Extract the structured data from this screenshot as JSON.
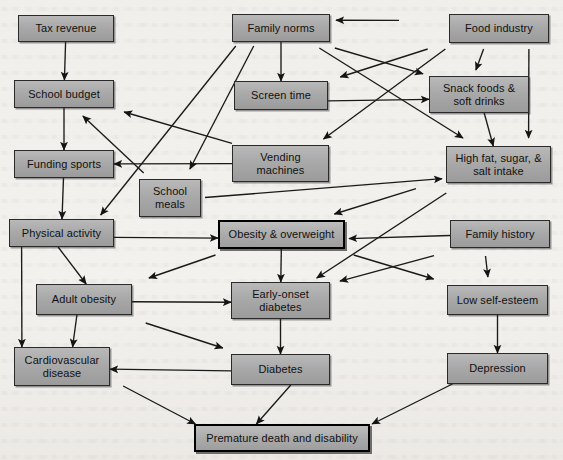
{
  "diagram": {
    "type": "flow-diagram",
    "canvas": {
      "width": 563,
      "height": 460
    },
    "style": {
      "background_color": "#f3f1ee",
      "node_fill_top": "#b9b9b9",
      "node_fill_bottom": "#9b9b9b",
      "node_border": "#2a2a2a",
      "emphasis_border": "#000000",
      "edge_color": "#1a1a1a",
      "text_color": "#111111"
    },
    "nodes": [
      {
        "id": "tax_revenue",
        "label": "Tax revenue",
        "x": 18,
        "y": 15,
        "w": 96,
        "h": 27,
        "emphasis": false
      },
      {
        "id": "school_budget",
        "label": "School budget",
        "x": 14,
        "y": 80,
        "w": 100,
        "h": 28,
        "emphasis": false
      },
      {
        "id": "funding_sports",
        "label": "Funding sports",
        "x": 14,
        "y": 150,
        "w": 100,
        "h": 28,
        "emphasis": false
      },
      {
        "id": "physical_activity",
        "label": "Physical activity",
        "x": 9,
        "y": 219,
        "w": 105,
        "h": 28,
        "emphasis": false
      },
      {
        "id": "adult_obesity",
        "label": "Adult obesity",
        "x": 36,
        "y": 284,
        "w": 96,
        "h": 31,
        "emphasis": false
      },
      {
        "id": "cardiovascular",
        "label": "Cardiovascular\ndisease",
        "x": 14,
        "y": 347,
        "w": 96,
        "h": 39,
        "emphasis": false
      },
      {
        "id": "school_meals",
        "label": "School\nmeals",
        "x": 139,
        "y": 179,
        "w": 62,
        "h": 38,
        "emphasis": false
      },
      {
        "id": "family_norms",
        "label": "Family norms",
        "x": 232,
        "y": 14,
        "w": 98,
        "h": 28,
        "emphasis": false
      },
      {
        "id": "screen_time",
        "label": "Screen time",
        "x": 234,
        "y": 81,
        "w": 94,
        "h": 29,
        "emphasis": false
      },
      {
        "id": "vending",
        "label": "Vending\nmachines",
        "x": 232,
        "y": 145,
        "w": 97,
        "h": 37,
        "emphasis": false
      },
      {
        "id": "obesity",
        "label": "Obesity & overweight",
        "x": 218,
        "y": 220,
        "w": 127,
        "h": 29,
        "emphasis": true
      },
      {
        "id": "early_diabetes",
        "label": "Early-onset\ndiabetes",
        "x": 231,
        "y": 282,
        "w": 99,
        "h": 37,
        "emphasis": false
      },
      {
        "id": "diabetes",
        "label": "Diabetes",
        "x": 231,
        "y": 354,
        "w": 99,
        "h": 31,
        "emphasis": false
      },
      {
        "id": "food_industry",
        "label": "Food industry",
        "x": 449,
        "y": 14,
        "w": 100,
        "h": 29,
        "emphasis": false
      },
      {
        "id": "snack_foods",
        "label": "Snack foods &\nsoft drinks",
        "x": 429,
        "y": 76,
        "w": 100,
        "h": 37,
        "emphasis": false
      },
      {
        "id": "high_fat",
        "label": "High fat, sugar, &\nsalt intake",
        "x": 446,
        "y": 146,
        "w": 105,
        "h": 37,
        "emphasis": false
      },
      {
        "id": "family_history",
        "label": "Family history",
        "x": 450,
        "y": 220,
        "w": 100,
        "h": 28,
        "emphasis": false
      },
      {
        "id": "low_self_esteem",
        "label": "Low self-esteem",
        "x": 447,
        "y": 285,
        "w": 101,
        "h": 30,
        "emphasis": false
      },
      {
        "id": "depression",
        "label": "Depression",
        "x": 447,
        "y": 353,
        "w": 101,
        "h": 31,
        "emphasis": false
      },
      {
        "id": "premature_death",
        "label": "Premature death and disability",
        "x": 194,
        "y": 424,
        "w": 176,
        "h": 28,
        "emphasis": true
      }
    ],
    "edges": [
      {
        "from": "tax_revenue",
        "to": "school_budget"
      },
      {
        "from": "school_budget",
        "to": "funding_sports"
      },
      {
        "from": "funding_sports",
        "to": "physical_activity"
      },
      {
        "from": "physical_activity",
        "to": "adult_obesity"
      },
      {
        "from": "physical_activity",
        "to": "cardiovascular"
      },
      {
        "from": "physical_activity",
        "to": "obesity"
      },
      {
        "from": "adult_obesity",
        "to": "cardiovascular"
      },
      {
        "from": "adult_obesity",
        "to": "early_diabetes"
      },
      {
        "from": "adult_obesity",
        "to": "diabetes"
      },
      {
        "from": "cardiovascular",
        "to": "premature_death"
      },
      {
        "from": "vending",
        "to": "school_budget"
      },
      {
        "from": "vending",
        "to": "funding_sports"
      },
      {
        "from": "school_meals",
        "to": "school_budget"
      },
      {
        "from": "school_meals",
        "to": "high_fat"
      },
      {
        "from": "family_norms",
        "to": "screen_time"
      },
      {
        "from": "family_norms",
        "to": "school_meals"
      },
      {
        "from": "family_norms",
        "to": "snack_foods"
      },
      {
        "from": "family_norms",
        "to": "high_fat"
      },
      {
        "from": "family_norms",
        "to": "physical_activity"
      },
      {
        "from": "screen_time",
        "to": "snack_foods"
      },
      {
        "from": "food_industry",
        "to": "family_norms"
      },
      {
        "from": "food_industry",
        "to": "snack_foods"
      },
      {
        "from": "food_industry",
        "to": "high_fat"
      },
      {
        "from": "food_industry",
        "to": "screen_time"
      },
      {
        "from": "food_industry",
        "to": "vending"
      },
      {
        "from": "snack_foods",
        "to": "high_fat"
      },
      {
        "from": "high_fat",
        "to": "obesity"
      },
      {
        "from": "high_fat",
        "to": "early_diabetes"
      },
      {
        "from": "obesity",
        "to": "adult_obesity"
      },
      {
        "from": "obesity",
        "to": "early_diabetes"
      },
      {
        "from": "early_diabetes",
        "to": "diabetes"
      },
      {
        "from": "diabetes",
        "to": "cardiovascular"
      },
      {
        "from": "diabetes",
        "to": "premature_death"
      },
      {
        "from": "family_history",
        "to": "obesity"
      },
      {
        "from": "family_history",
        "to": "early_diabetes"
      },
      {
        "from": "family_history",
        "to": "low_self_esteem"
      },
      {
        "from": "obesity",
        "to": "low_self_esteem"
      },
      {
        "from": "low_self_esteem",
        "to": "depression"
      },
      {
        "from": "depression",
        "to": "premature_death"
      }
    ]
  }
}
